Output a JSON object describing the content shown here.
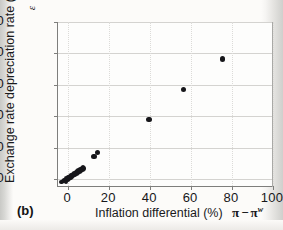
{
  "figure": {
    "panel_label": "(b)"
  },
  "axes": {
    "y_title": "Exchange rate depreciation rate (%)",
    "y_symbol": "ε",
    "x_title": "Inflation differential (%)",
    "x_symbol_pi": "π",
    "x_symbol_minus": "−",
    "x_symbol_pi_w": "π",
    "x_symbol_sup": "w",
    "y_ticks": [
      "0",
      "20",
      "40",
      "60",
      "80",
      "100"
    ],
    "x_ticks": [
      "0",
      "20",
      "40",
      "60",
      "80",
      "100"
    ]
  },
  "colors": {
    "marker": "#16161a",
    "axis": "#7e7e7c",
    "grid": "#d4d3d0",
    "background": "#fcfbf9",
    "text": "#17171a"
  },
  "chart_data": {
    "type": "scatter",
    "title": "",
    "xlabel": "Inflation differential (%)",
    "ylabel": "Exchange rate depreciation rate (%)",
    "xlim": [
      -5,
      100
    ],
    "ylim": [
      -5,
      100
    ],
    "xticks": [
      0,
      20,
      40,
      60,
      80,
      100
    ],
    "yticks": [
      0,
      20,
      40,
      60,
      80,
      100
    ],
    "grid": true,
    "legend": null,
    "series": [
      {
        "name": "Countries",
        "points": [
          [
            -3.2,
            -1.8
          ],
          [
            -2.6,
            -1.2
          ],
          [
            -2.0,
            -0.9
          ],
          [
            -1.6,
            -0.4
          ],
          [
            -1.2,
            -1.6
          ],
          [
            -0.8,
            0.3
          ],
          [
            -0.4,
            -0.6
          ],
          [
            -0.2,
            1.0
          ],
          [
            0.2,
            0.1
          ],
          [
            0.4,
            1.4
          ],
          [
            0.7,
            0.6
          ],
          [
            0.9,
            1.9
          ],
          [
            1.1,
            1.1
          ],
          [
            1.4,
            2.3
          ],
          [
            1.6,
            1.5
          ],
          [
            1.9,
            2.8
          ],
          [
            2.2,
            2.0
          ],
          [
            2.5,
            3.3
          ],
          [
            2.8,
            2.6
          ],
          [
            3.1,
            3.8
          ],
          [
            3.4,
            3.0
          ],
          [
            3.7,
            4.4
          ],
          [
            4.0,
            3.6
          ],
          [
            4.3,
            5.0
          ],
          [
            4.7,
            4.2
          ],
          [
            5.1,
            5.6
          ],
          [
            5.5,
            4.9
          ],
          [
            5.9,
            6.4
          ],
          [
            6.3,
            5.5
          ],
          [
            6.7,
            7.1
          ],
          [
            7.0,
            6.2
          ],
          [
            7.3,
            7.6
          ],
          [
            7.6,
            6.8
          ],
          [
            12.6,
            14.2
          ],
          [
            14.4,
            16.8
          ],
          [
            39.4,
            38.2
          ],
          [
            56.4,
            56.8
          ],
          [
            75.4,
            76.4
          ]
        ]
      }
    ]
  }
}
